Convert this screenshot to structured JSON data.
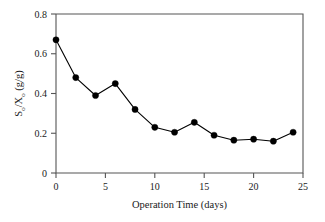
{
  "chart_data": {
    "type": "line",
    "title": "",
    "xlabel": "Operation Time (days)",
    "ylabel": "S_o/X_o (g/g)",
    "ylabel_parts": {
      "s": "S",
      "sub1": "o",
      "slash": "/",
      "x": "X",
      "sub2": "o",
      "units": " (g/g)"
    },
    "x": [
      0,
      2,
      4,
      6,
      8,
      10,
      12,
      14,
      16,
      18,
      20,
      22,
      24
    ],
    "values": [
      0.67,
      0.48,
      0.39,
      0.45,
      0.32,
      0.23,
      0.205,
      0.255,
      0.19,
      0.165,
      0.17,
      0.16,
      0.205
    ],
    "series": [
      {
        "name": "So/Xo",
        "values": [
          0.67,
          0.48,
          0.39,
          0.45,
          0.32,
          0.23,
          0.205,
          0.255,
          0.19,
          0.165,
          0.17,
          0.16,
          0.205
        ]
      }
    ],
    "xlim": [
      0,
      25
    ],
    "ylim": [
      0,
      0.8
    ],
    "xticks": [
      0,
      5,
      10,
      15,
      20,
      25
    ],
    "xtick_labels": [
      "0",
      "5",
      "10",
      "15",
      "20",
      "25"
    ],
    "yticks": [
      0,
      0.2,
      0.4,
      0.6,
      0.8
    ],
    "ytick_labels": [
      "0",
      "0.2",
      "0.4",
      "0.6",
      "0.8"
    ],
    "grid": false,
    "legend": null,
    "legend_position": "none",
    "marker": "circle",
    "marker_color": "#000000",
    "line_color": "#000000",
    "axis_color": "#555555",
    "background_color": "#ffffff",
    "tick_direction": "out"
  }
}
